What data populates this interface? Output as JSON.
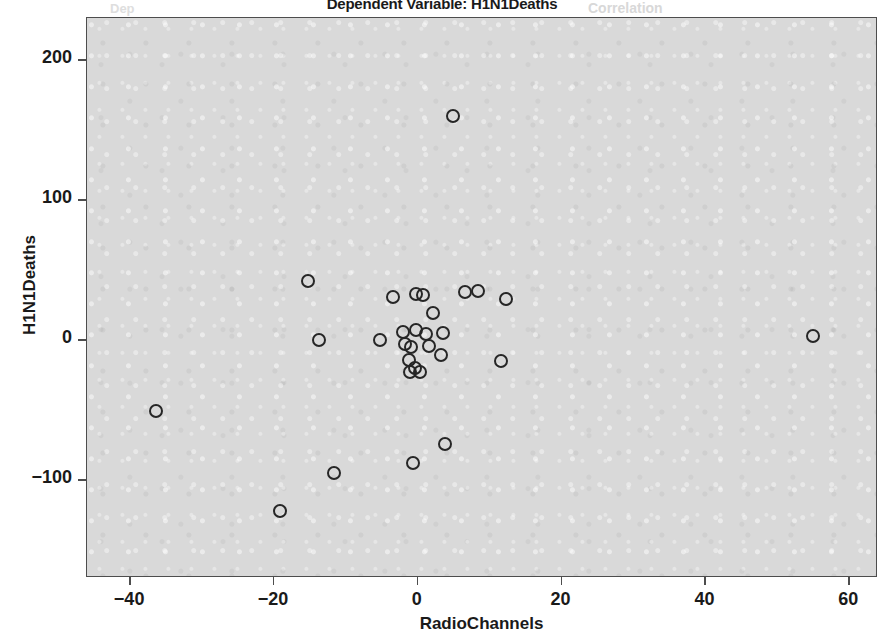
{
  "chart_data": {
    "type": "scatter",
    "title": "Dependent Variable: H1N1Deaths",
    "xlabel": "RadioChannels",
    "ylabel": "H1N1Deaths",
    "xlim": [
      -46,
      64
    ],
    "ylim": [
      -170,
      230
    ],
    "xticks": [
      -40,
      -20,
      0,
      20,
      40,
      60
    ],
    "xtick_labels": [
      "−40",
      "−20",
      "0",
      "20",
      "40",
      "60"
    ],
    "yticks": [
      200,
      100,
      0,
      -100
    ],
    "ytick_labels": [
      "200",
      "100",
      "0",
      "−100"
    ],
    "grid": false,
    "legend": null,
    "marker": "open-circle",
    "marker_color": "#262626",
    "panel_background": "#d9d9d9",
    "points": [
      {
        "x": 4.9,
        "y": 160
      },
      {
        "x": -15.2,
        "y": 42
      },
      {
        "x": -3.5,
        "y": 31
      },
      {
        "x": -0.3,
        "y": 33
      },
      {
        "x": 0.7,
        "y": 32
      },
      {
        "x": 6.6,
        "y": 34
      },
      {
        "x": 8.4,
        "y": 35
      },
      {
        "x": 12.3,
        "y": 29
      },
      {
        "x": 2.1,
        "y": 19
      },
      {
        "x": -13.7,
        "y": 0
      },
      {
        "x": -5.3,
        "y": 0
      },
      {
        "x": -2.0,
        "y": 6
      },
      {
        "x": -0.2,
        "y": 7
      },
      {
        "x": 1.2,
        "y": 4
      },
      {
        "x": 3.5,
        "y": 5
      },
      {
        "x": -1.8,
        "y": -3
      },
      {
        "x": -1.0,
        "y": -5
      },
      {
        "x": 1.5,
        "y": -4
      },
      {
        "x": 3.2,
        "y": -11
      },
      {
        "x": 11.6,
        "y": -15
      },
      {
        "x": -1.2,
        "y": -14
      },
      {
        "x": -0.4,
        "y": -20
      },
      {
        "x": -1.1,
        "y": -23
      },
      {
        "x": 0.3,
        "y": -23
      },
      {
        "x": 55.0,
        "y": 3
      },
      {
        "x": -36.4,
        "y": -51
      },
      {
        "x": -11.7,
        "y": -95
      },
      {
        "x": -0.7,
        "y": -88
      },
      {
        "x": 3.8,
        "y": -74
      },
      {
        "x": -19.1,
        "y": -122
      }
    ]
  },
  "scan_artifacts": {
    "ghost_right": "Correlation",
    "ghost_left": "Dep"
  }
}
